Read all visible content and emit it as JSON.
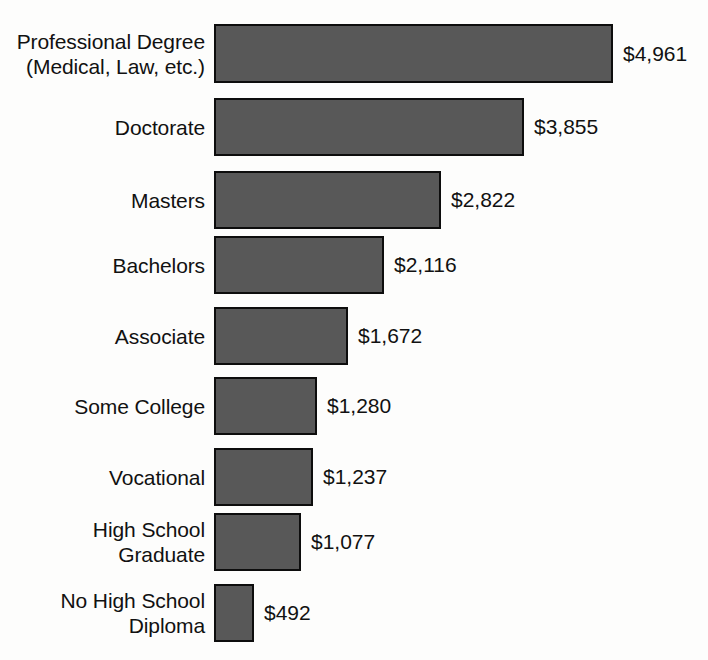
{
  "chart_data": {
    "type": "bar",
    "orientation": "horizontal",
    "title": "",
    "subtitle": "",
    "xlabel": "",
    "ylabel": "",
    "grid": false,
    "legend": "none",
    "xlim": [
      0,
      4961
    ],
    "value_prefix": "$",
    "categories": [
      "Professional Degree\n(Medical, Law, etc.)",
      "Doctorate",
      "Masters",
      "Bachelors",
      "Associate",
      "Some College",
      "Vocational",
      "High School\nGraduate",
      "No High School\nDiploma"
    ],
    "values": [
      4961,
      3855,
      2822,
      2116,
      1672,
      1280,
      1237,
      1077,
      492
    ],
    "value_labels": [
      "$4,961",
      "$3,855",
      "$2,822",
      "$2,116",
      "$1,672",
      "$1,280",
      "$1,237",
      "$1,077",
      "$492"
    ],
    "bars": [
      {
        "label": "Professional Degree\n(Medical, Law, etc.)",
        "value": 4961,
        "value_label": "$4,961",
        "top": 24,
        "height": 59,
        "width": 399
      },
      {
        "label": "Doctorate",
        "value": 3855,
        "value_label": "$3,855",
        "top": 98,
        "height": 58,
        "width": 310
      },
      {
        "label": "Masters",
        "value": 2822,
        "value_label": "$2,822",
        "top": 171,
        "height": 58,
        "width": 227
      },
      {
        "label": "Bachelors",
        "value": 2116,
        "value_label": "$2,116",
        "top": 236,
        "height": 58,
        "width": 170
      },
      {
        "label": "Associate",
        "value": 1672,
        "value_label": "$1,672",
        "top": 307,
        "height": 58,
        "width": 134
      },
      {
        "label": "Some College",
        "value": 1280,
        "value_label": "$1,280",
        "top": 377,
        "height": 58,
        "width": 103
      },
      {
        "label": "Vocational",
        "value": 1237,
        "value_label": "$1,237",
        "top": 448,
        "height": 58,
        "width": 99
      },
      {
        "label": "High School\nGraduate",
        "value": 1077,
        "value_label": "$1,077",
        "top": 513,
        "height": 58,
        "width": 87
      },
      {
        "label": "No High School\nDiploma",
        "value": 492,
        "value_label": "$492",
        "top": 584,
        "height": 58,
        "width": 40
      }
    ]
  },
  "colors": {
    "bar_fill": "#585858",
    "bar_border": "#0d0d0d",
    "background": "#fdfdfc",
    "text": "#111111"
  }
}
